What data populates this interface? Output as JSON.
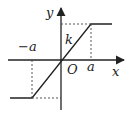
{
  "diagram": {
    "type": "saturation-function-graph",
    "labels": {
      "y_axis": "y",
      "x_axis": "x",
      "origin": "O",
      "slope": "k",
      "pos_a": "a",
      "neg_a": "−a"
    },
    "colors": {
      "stroke": "#222222",
      "background": "#ffffff"
    }
  }
}
